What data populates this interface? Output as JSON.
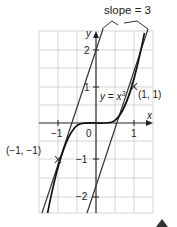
{
  "diagram": {
    "annotation": "slope = 3",
    "axis_x_label": "x",
    "axis_y_label": "y",
    "curve_label_prefix": "y = x",
    "curve_label_exp": "3",
    "point_upper": "(1, 1)",
    "point_lower": "(−1, −1)",
    "ticks_x": [
      "−1",
      "0",
      "1"
    ],
    "ticks_y": [
      "2",
      "1",
      "−1",
      "−2"
    ],
    "colors": {
      "grid": "#c8c8c8",
      "curve": "#222222",
      "axis": "#222222",
      "tangent": "#333333",
      "marker": "#333333"
    }
  }
}
